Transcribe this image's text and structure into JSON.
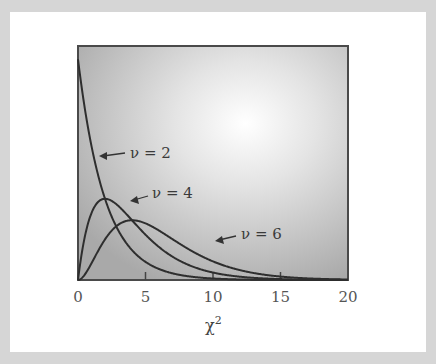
{
  "chart_data": {
    "type": "line",
    "title": "",
    "xlabel": "χ",
    "xlabel_superscript": "2",
    "ylabel": "",
    "xlim": [
      0,
      20
    ],
    "ylim": [
      0,
      0.53
    ],
    "grid": false,
    "legend": "inline annotations with arrows",
    "x_ticks": [
      "0",
      "5",
      "10",
      "15",
      "20"
    ],
    "series": [
      {
        "name": "ν = 2",
        "df": 2,
        "label": "ν = 2",
        "x": [
          0,
          1,
          2,
          3,
          4,
          5,
          6,
          8,
          10,
          12,
          15,
          20
        ],
        "values": [
          0.5,
          0.303,
          0.184,
          0.112,
          0.068,
          0.041,
          0.025,
          0.009,
          0.003,
          0.001,
          0.0003,
          2e-05
        ]
      },
      {
        "name": "ν = 4",
        "df": 4,
        "label": "ν = 4",
        "x": [
          0,
          1,
          2,
          3,
          4,
          5,
          6,
          8,
          10,
          12,
          15,
          20
        ],
        "values": [
          0,
          0.152,
          0.184,
          0.167,
          0.135,
          0.103,
          0.075,
          0.037,
          0.017,
          0.007,
          0.002,
          0.0002
        ]
      },
      {
        "name": "ν = 6",
        "df": 6,
        "label": "ν = 6",
        "x": [
          0,
          1,
          2,
          3,
          4,
          5,
          6,
          8,
          10,
          12,
          15,
          20
        ],
        "values": [
          0,
          0.038,
          0.092,
          0.126,
          0.135,
          0.128,
          0.112,
          0.073,
          0.042,
          0.022,
          0.007,
          0.001
        ]
      }
    ]
  },
  "labels": {
    "nu2": "ν = 2",
    "nu4": "ν = 4",
    "nu6": "ν = 6",
    "xtitle": "χ",
    "xtitle_sup": "2",
    "ticks": [
      "0",
      "5",
      "10",
      "15",
      "20"
    ]
  }
}
